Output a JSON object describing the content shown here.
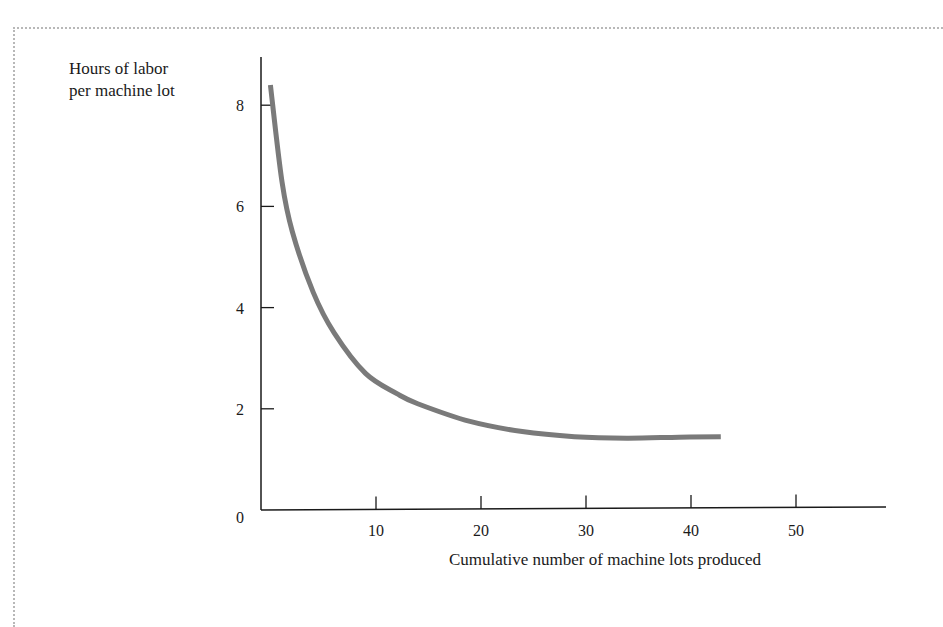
{
  "chart_data": {
    "type": "line",
    "title": "",
    "xlabel": "Cumulative number of machine lots produced",
    "ylabel": "Hours of labor per machine lot",
    "ylabel_lines": [
      "Hours of  labor",
      "per machine lot"
    ],
    "xlim": [
      0,
      60
    ],
    "ylim": [
      0,
      9
    ],
    "x_ticks": [
      10,
      20,
      30,
      40,
      50
    ],
    "y_ticks": [
      0,
      2,
      4,
      6,
      8
    ],
    "x_tick_labels": [
      "10",
      "20",
      "30",
      "40",
      "50"
    ],
    "y_tick_labels": [
      "0",
      "2",
      "4",
      "6",
      "8"
    ],
    "grid": false,
    "legend": null,
    "series": [
      {
        "name": "Learning curve",
        "color": "#7a7a7a",
        "x": [
          0.9,
          2,
          3,
          5,
          7,
          10,
          13,
          15,
          20,
          25,
          30,
          35,
          40,
          44
        ],
        "y": [
          8.4,
          6.5,
          5.5,
          4.3,
          3.5,
          2.7,
          2.3,
          2.1,
          1.75,
          1.55,
          1.45,
          1.42,
          1.44,
          1.45
        ]
      }
    ]
  }
}
